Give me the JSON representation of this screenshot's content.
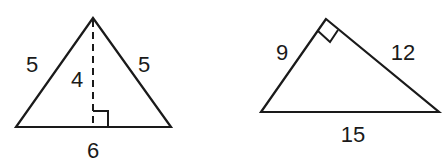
{
  "figures": [
    {
      "id": "isosceles-triangle",
      "type": "isosceles triangle with altitude",
      "vertices": {
        "apex": [
          93,
          18
        ],
        "base_left": [
          16,
          127
        ],
        "base_right": [
          171,
          127
        ]
      },
      "altitude_foot": [
        93,
        127
      ],
      "labels": {
        "left_side": "5",
        "right_side": "5",
        "height": "4",
        "base": "6"
      },
      "right_angle_marker": "at altitude foot"
    },
    {
      "id": "right-triangle",
      "type": "right triangle",
      "vertices": {
        "right_angle": [
          326,
          19
        ],
        "bottom_left": [
          261,
          112
        ],
        "bottom_right": [
          439,
          112
        ]
      },
      "labels": {
        "short_leg": "9",
        "long_leg": "12",
        "hypotenuse": "15"
      },
      "right_angle_marker": "at top vertex"
    }
  ],
  "colors": {
    "stroke": "#1a1a1a",
    "background": "#ffffff"
  }
}
